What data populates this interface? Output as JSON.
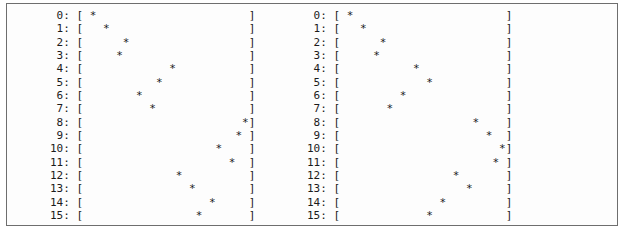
{
  "window": {
    "title": "ASCII Plot Output",
    "border_color": "#6e6e6e",
    "background_color": "#fdfdfd",
    "text_color": "#1b1b1b"
  },
  "plot_format": {
    "row_label_suffix": ":",
    "open_bracket": "[",
    "close_bracket": "]",
    "marker": "*",
    "blank": " ",
    "inner_width": 25,
    "label_width": 2
  },
  "panels": [
    {
      "name": "left-plot",
      "rows": [
        {
          "label": "0",
          "marker_column": 1
        },
        {
          "label": "1",
          "marker_column": 3
        },
        {
          "label": "2",
          "marker_column": 6
        },
        {
          "label": "3",
          "marker_column": 5
        },
        {
          "label": "4",
          "marker_column": 13
        },
        {
          "label": "5",
          "marker_column": 11
        },
        {
          "label": "6",
          "marker_column": 8
        },
        {
          "label": "7",
          "marker_column": 10
        },
        {
          "label": "8",
          "marker_column": 24
        },
        {
          "label": "9",
          "marker_column": 23
        },
        {
          "label": "10",
          "marker_column": 20
        },
        {
          "label": "11",
          "marker_column": 22
        },
        {
          "label": "12",
          "marker_column": 14
        },
        {
          "label": "13",
          "marker_column": 16
        },
        {
          "label": "14",
          "marker_column": 19
        },
        {
          "label": "15",
          "marker_column": 17
        }
      ]
    },
    {
      "name": "right-plot",
      "rows": [
        {
          "label": "0",
          "marker_column": 1
        },
        {
          "label": "1",
          "marker_column": 3
        },
        {
          "label": "2",
          "marker_column": 6
        },
        {
          "label": "3",
          "marker_column": 5
        },
        {
          "label": "4",
          "marker_column": 11
        },
        {
          "label": "5",
          "marker_column": 13
        },
        {
          "label": "6",
          "marker_column": 9
        },
        {
          "label": "7",
          "marker_column": 7
        },
        {
          "label": "8",
          "marker_column": 20
        },
        {
          "label": "9",
          "marker_column": 22
        },
        {
          "label": "10",
          "marker_column": 24
        },
        {
          "label": "11",
          "marker_column": 23
        },
        {
          "label": "12",
          "marker_column": 17
        },
        {
          "label": "13",
          "marker_column": 19
        },
        {
          "label": "14",
          "marker_column": 15
        },
        {
          "label": "15",
          "marker_column": 13
        }
      ]
    }
  ],
  "chart_data": {
    "type": "scatter",
    "title": "",
    "xlabel": "",
    "ylabel": "",
    "grid": false,
    "legend": null,
    "xlim": [
      0,
      24
    ],
    "ylim": [
      0,
      15
    ],
    "series": [
      {
        "name": "left-plot",
        "x": [
          1,
          3,
          6,
          5,
          13,
          11,
          8,
          10,
          24,
          23,
          20,
          22,
          14,
          16,
          19,
          17
        ],
        "y": [
          0,
          1,
          2,
          3,
          4,
          5,
          6,
          7,
          8,
          9,
          10,
          11,
          12,
          13,
          14,
          15
        ]
      },
      {
        "name": "right-plot",
        "x": [
          1,
          3,
          6,
          5,
          11,
          13,
          9,
          7,
          20,
          22,
          24,
          23,
          17,
          19,
          15,
          13
        ],
        "y": [
          0,
          1,
          2,
          3,
          4,
          5,
          6,
          7,
          8,
          9,
          10,
          11,
          12,
          13,
          14,
          15
        ]
      }
    ]
  }
}
